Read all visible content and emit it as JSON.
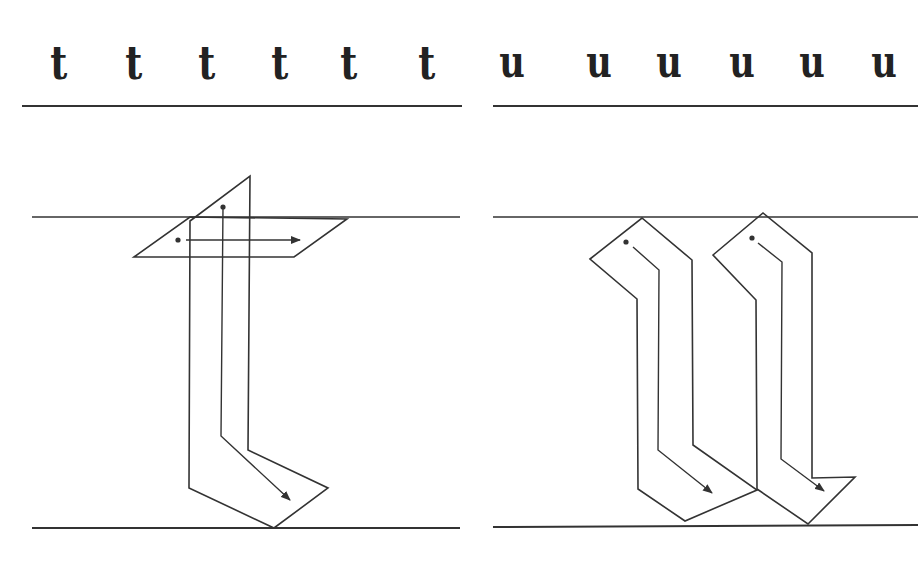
{
  "colors": {
    "ink": "#333333",
    "paper": "#ffffff"
  },
  "sample_rows": {
    "t": {
      "letter": "t",
      "positions": [
        60,
        135,
        208,
        281,
        350,
        428
      ]
    },
    "u": {
      "letter": "u",
      "positions": [
        508,
        595,
        665,
        738,
        808,
        880
      ]
    }
  },
  "guide_lines": [
    {
      "name": "sample-baseline-left",
      "x1": 22,
      "y1": 106,
      "x2": 462,
      "y2": 106,
      "w": 2
    },
    {
      "name": "sample-baseline-right",
      "x1": 493,
      "y1": 106,
      "x2": 918,
      "y2": 106,
      "w": 2
    },
    {
      "name": "waistline-left",
      "x1": 32,
      "y1": 217,
      "x2": 460,
      "y2": 217,
      "w": 1.6
    },
    {
      "name": "waistline-right",
      "x1": 493,
      "y1": 217,
      "x2": 918,
      "y2": 217,
      "w": 1.6
    },
    {
      "name": "baseline-left",
      "x1": 32,
      "y1": 528,
      "x2": 460,
      "y2": 528,
      "w": 2
    },
    {
      "name": "baseline-right",
      "x1": 493,
      "y1": 527,
      "x2": 918,
      "y2": 525,
      "w": 2
    }
  ],
  "letter_t": {
    "stem_outline": "190,221 250,176 248,450 328,488 274,528 189,488 Z",
    "crossbar_outline": "134,257 190,217 347,219 294,257 Z",
    "strokes": [
      {
        "start": [
          223,
          207
        ],
        "path": "223,207 221,436 290,500"
      },
      {
        "start": [
          178,
          240
        ],
        "path": "186,240 300,240"
      }
    ]
  },
  "letter_u": {
    "outlines": [
      "590,259 642,218 692,260 693,445 757,490 685,521 638,489 637,299 Z",
      "713,255 763,213 812,253 812,478 855,477 808,524 757,489 756,300 Z"
    ],
    "strokes": [
      {
        "start": [
          626,
          242
        ],
        "path": "633,247 659,270 658,450 712,493"
      },
      {
        "start": [
          752,
          238
        ],
        "path": "758,243 782,262 781,459 824,491"
      }
    ]
  }
}
